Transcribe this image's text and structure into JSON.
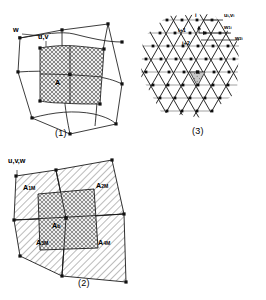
{
  "figure": {
    "panels": [
      {
        "id": "1",
        "caption": "(1)",
        "labels": {
          "w": "w",
          "uv": "u,v",
          "area": "A"
        },
        "description": "Distorted quadrilateral staggered grid with one cross-hatched control volume A"
      },
      {
        "id": "2",
        "caption": "(2)",
        "labels": {
          "uvw": "u,v,w",
          "a1m": "A",
          "a1m_sub": "1M",
          "a2m": "A",
          "a2m_sub": "2M",
          "a3m": "A",
          "a3m_sub": "3M",
          "a4m": "A",
          "a4m_sub": "4M",
          "ab": "A",
          "ab_sub": "b"
        },
        "description": "Quadrilateral cell subdivided into four hatched sub-areas A1M..A4M around a central cross-hatched area Ab"
      },
      {
        "id": "3",
        "caption": "(3)",
        "labels": {
          "node_i": "i",
          "node_i1": "i+1",
          "node_i2": "i+2",
          "uv_i": "u",
          "uv_i_sub": "i",
          "uv_i2": ",v",
          "uv_i2_sub": "i",
          "w1i": "w",
          "w1i_sub": "1i",
          "w2i": "w",
          "w2i_sub": "2i",
          "center": "A"
        },
        "description": "Hexagonal triangular lattice of nodes with shaded central triangle and node index annotations"
      }
    ],
    "colors": {
      "stroke": "#1a1a1a",
      "hatch": "#4a4a4a",
      "fill_light": "#e9e9e9",
      "fill_grey": "#bdbdbd",
      "node": "#111111",
      "background": "#ffffff"
    }
  }
}
